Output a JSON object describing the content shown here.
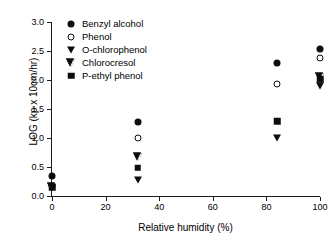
{
  "chart_data": {
    "type": "scatter",
    "title": "",
    "xlabel": "Relative humidity (%)",
    "ylabel": "LOG (kp x 10cm/hr)",
    "xlim": [
      0,
      100
    ],
    "ylim": [
      0.0,
      3.0
    ],
    "xticks": [
      "0",
      "20",
      "40",
      "60",
      "80",
      "100"
    ],
    "xtick_values": [
      0,
      20,
      40,
      60,
      80,
      100
    ],
    "yticks": [
      "0.0",
      "0.5",
      "1.0",
      "1.5",
      "2.0",
      "2.5",
      "3.0"
    ],
    "ytick_values": [
      0.0,
      0.5,
      1.0,
      1.5,
      2.0,
      2.5,
      3.0
    ],
    "grid": false,
    "legend_position": "top-left-inside",
    "x": [
      0,
      32,
      84,
      100
    ],
    "series": [
      {
        "name": "Benzyl alcohol",
        "marker": "filled-circle",
        "color": "#0d0d0d",
        "x": [
          0,
          32,
          84,
          100
        ],
        "values": [
          0.34,
          1.28,
          2.29,
          2.54
        ]
      },
      {
        "name": "Phenol",
        "marker": "open-circle",
        "color": "#0d0d0d",
        "x": [
          0,
          32,
          84,
          100
        ],
        "values": [
          0.18,
          1.0,
          1.93,
          2.38
        ]
      },
      {
        "name": "O-chlorophenol",
        "marker": "filled-triangle-down",
        "color": "#0d0d0d",
        "x": [
          0,
          32,
          84,
          100
        ],
        "values": [
          0.14,
          0.28,
          1.0,
          1.89
        ]
      },
      {
        "name": "Chlorocresol",
        "marker": "open-triangle-down",
        "color": "#0d0d0d",
        "x": [
          0,
          32,
          100
        ],
        "values": [
          0.16,
          0.8,
          2.3
        ]
      },
      {
        "name": "P-ethyl phenol",
        "marker": "filled-square",
        "color": "#0d0d0d",
        "x": [
          0,
          32,
          84,
          100
        ],
        "values": [
          0.15,
          0.49,
          1.29,
          2.01
        ]
      }
    ]
  },
  "legend": {
    "items": [
      {
        "label": "Benzyl alcohol",
        "marker": "filled-circle"
      },
      {
        "label": "Phenol",
        "marker": "open-circle"
      },
      {
        "label": "O-chlorophenol",
        "marker": "filled-triangle-down"
      },
      {
        "label": "Chlorocresol",
        "marker": "open-triangle-down"
      },
      {
        "label": "P-ethyl phenol",
        "marker": "filled-square"
      }
    ]
  }
}
